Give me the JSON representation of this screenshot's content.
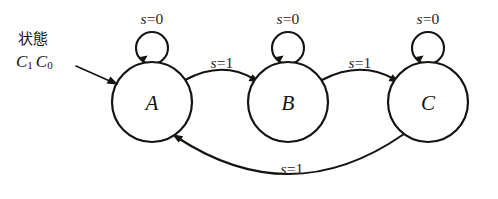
{
  "diagram": {
    "kind": "finite-state-machine",
    "background_color": "#ffffff",
    "stroke_color": "#15130f",
    "annotation": {
      "title": "状態",
      "symbols": "C1C0",
      "symbol_base_1": "C",
      "symbol_sub_1": "1",
      "symbol_base_2": "C",
      "symbol_sub_2": "0",
      "points_to": "A"
    },
    "states": [
      {
        "id": "A",
        "label": "A",
        "cx": 152,
        "cy": 102,
        "r": 40
      },
      {
        "id": "B",
        "label": "B",
        "cx": 288,
        "cy": 102,
        "r": 40
      },
      {
        "id": "C",
        "label": "C",
        "cx": 428,
        "cy": 102,
        "r": 40
      }
    ],
    "self_loops": [
      {
        "state": "A",
        "label": "s=0",
        "label_var": "s",
        "label_rest": "=0",
        "cx": 152,
        "cy": 48,
        "r": 16,
        "label_x": 152,
        "label_y": 18
      },
      {
        "state": "B",
        "label": "s=0",
        "label_var": "s",
        "label_rest": "=0",
        "cx": 288,
        "cy": 48,
        "r": 16,
        "label_x": 288,
        "label_y": 18
      },
      {
        "state": "C",
        "label": "s=0",
        "label_var": "s",
        "label_rest": "=0",
        "cx": 428,
        "cy": 48,
        "r": 16,
        "label_x": 428,
        "label_y": 18
      }
    ],
    "transitions": [
      {
        "from": "A",
        "to": "B",
        "label": "s=1",
        "label_var": "s",
        "label_rest": "=1",
        "label_x": 222,
        "label_y": 62
      },
      {
        "from": "B",
        "to": "C",
        "label": "s=1",
        "label_var": "s",
        "label_rest": "=1",
        "label_x": 360,
        "label_y": 62
      },
      {
        "from": "C",
        "to": "A",
        "label": "s=1",
        "label_var": "s",
        "label_rest": "=1",
        "label_x": 292,
        "label_y": 168
      }
    ]
  }
}
